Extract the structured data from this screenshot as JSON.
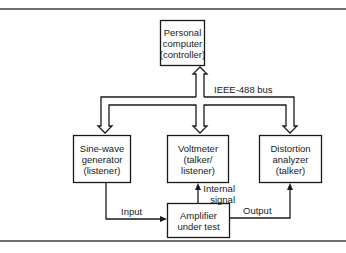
{
  "diagram": {
    "bus_label": "IEEE-488 bus",
    "nodes": {
      "pc": {
        "lines": [
          "Personal",
          "computer",
          "(controller)"
        ]
      },
      "sine": {
        "lines": [
          "Sine-wave",
          "generator",
          "(listener)"
        ]
      },
      "voltmeter": {
        "lines": [
          "Voltmeter",
          "(talker/",
          "listener)"
        ]
      },
      "distortion": {
        "lines": [
          "Distortion",
          "analyzer",
          "(talker)"
        ]
      },
      "amplifier": {
        "lines": [
          "Amplifier",
          "under test"
        ]
      }
    },
    "edges": {
      "input": "Input",
      "output": "Output",
      "internal_signal": [
        "Internal",
        "signal"
      ]
    },
    "colors": {
      "line": "#1a1a1a",
      "rule": "#6f6f6f",
      "background": "#ffffff"
    }
  }
}
